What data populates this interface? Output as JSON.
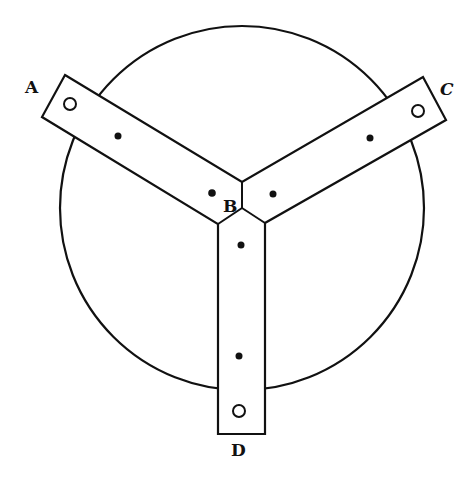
{
  "figure": {
    "labels": {
      "A": "A",
      "B": "B",
      "C": "C",
      "D": "D"
    },
    "colors": {
      "stroke": "#111111",
      "background": "#ffffff"
    },
    "circle": {
      "cx": 242,
      "cy": 208,
      "r": 182
    },
    "arms": [
      {
        "name": "arm-A",
        "end_label": "A",
        "end_hole": "open",
        "mid_hole": "filled"
      },
      {
        "name": "arm-C",
        "end_label": "C",
        "end_hole": "open",
        "mid_hole": "filled"
      },
      {
        "name": "arm-D",
        "end_label": "D",
        "end_hole": "open",
        "mid_hole": "filled"
      }
    ],
    "hub_label": "B"
  }
}
